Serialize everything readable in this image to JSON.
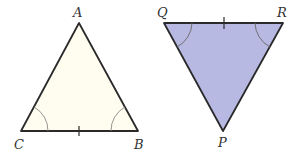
{
  "diagram": {
    "triangle_left": {
      "vertices": {
        "A": "A",
        "B": "B",
        "C": "C"
      },
      "fill": "#fffdf0",
      "stroke": "#2a2a2a",
      "equal_angles": [
        "C",
        "B"
      ],
      "tick_side": "CB"
    },
    "triangle_right": {
      "vertices": {
        "Q": "Q",
        "R": "R",
        "P": "P"
      },
      "fill": "#b8b9e3",
      "stroke": "#2a2a2a",
      "equal_angles": [
        "Q",
        "R"
      ],
      "tick_side": "QR"
    }
  }
}
